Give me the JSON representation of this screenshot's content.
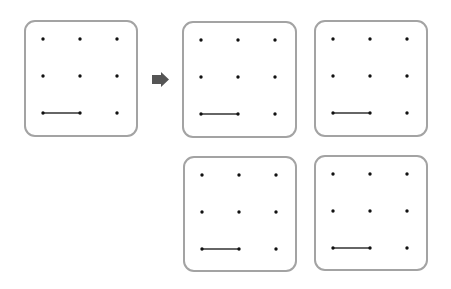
{
  "diagram": {
    "colors": {
      "border": "#a3a3a3",
      "dot": "#111111",
      "line": "#333333",
      "arrow": "#555555",
      "background": "#ffffff"
    },
    "grid": {
      "rows": 3,
      "cols": 3,
      "dot_spacing": 37,
      "dot_offset": 19
    },
    "arrow": {
      "icon": "right-arrow-icon",
      "direction": "right"
    },
    "panels": [
      {
        "id": "source",
        "role": "source",
        "x": 24,
        "y": 20,
        "w": 114,
        "h": 117,
        "segments": [
          {
            "from": [
              2,
              0
            ],
            "to": [
              2,
              1
            ]
          }
        ]
      },
      {
        "id": "option-1",
        "role": "option",
        "x": 182,
        "y": 21,
        "w": 115,
        "h": 117,
        "segments": [
          {
            "from": [
              2,
              0
            ],
            "to": [
              2,
              1
            ]
          }
        ]
      },
      {
        "id": "option-2",
        "role": "option",
        "x": 314,
        "y": 20,
        "w": 114,
        "h": 117,
        "segments": [
          {
            "from": [
              2,
              0
            ],
            "to": [
              2,
              1
            ]
          }
        ]
      },
      {
        "id": "option-3",
        "role": "option",
        "x": 183,
        "y": 156,
        "w": 114,
        "h": 116,
        "segments": [
          {
            "from": [
              2,
              0
            ],
            "to": [
              2,
              1
            ]
          }
        ]
      },
      {
        "id": "option-4",
        "role": "option",
        "x": 314,
        "y": 155,
        "w": 114,
        "h": 116,
        "segments": [
          {
            "from": [
              2,
              0
            ],
            "to": [
              2,
              1
            ]
          }
        ]
      }
    ]
  }
}
